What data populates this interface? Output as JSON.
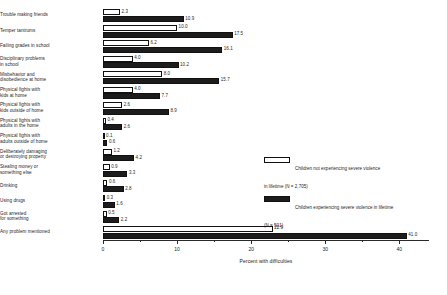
{
  "chart_data": {
    "type": "bar",
    "orientation": "horizontal",
    "title": "",
    "xlabel": "Percent with difficulties",
    "ylabel": "",
    "xlim": [
      0,
      44
    ],
    "grid": false,
    "legend_position": "right-middle",
    "tick_labels": [
      "0",
      "10",
      "20",
      "30",
      "40"
    ],
    "tick_values": [
      0,
      10,
      20,
      30,
      40
    ],
    "minor_tick_values": [
      5,
      15,
      25,
      35
    ],
    "categories": [
      "Trouble making friends",
      "Temper tantrums",
      "Failing grades in school",
      "Disciplinary problems\nin school",
      "Misbehavior and\ndisobedience at home",
      "Physical fights with\nkids at home",
      "Physical fights with\nkids outside of home",
      "Physical fights with\nadults in the home",
      "Physical fights with\nadults outside of home",
      "Deliberately damaging\nor destroying property",
      "Stealing money or\nsomething else",
      "Drinking",
      "Using drugs",
      "Got arrested\nfor something",
      "Any problem mentioned"
    ],
    "series": [
      {
        "name": "Children not experiencing severe violence in lifetime (N = 2,705)",
        "color": "#ffffff",
        "values": [
          2.3,
          10.0,
          6.2,
          4.0,
          8.0,
          4.0,
          2.6,
          0.4,
          0.1,
          1.2,
          0.9,
          0.6,
          0.3,
          0.5,
          22.9
        ]
      },
      {
        "name": "Children experiencing severe violence in lifetime (N = 501)",
        "color": "#1c1c1c",
        "values": [
          10.9,
          17.5,
          16.1,
          10.2,
          15.7,
          7.7,
          8.9,
          2.6,
          0.6,
          4.2,
          3.3,
          2.8,
          1.6,
          2.2,
          41.0
        ]
      }
    ]
  },
  "legend": {
    "entries": [
      {
        "swatch": "light",
        "text": "Children not experiencing severe violence\nin lifetime (N = 2,705)"
      },
      {
        "swatch": "dark",
        "text": "Children experiencing severe violence in lifetime\n(N = 501)"
      }
    ]
  }
}
